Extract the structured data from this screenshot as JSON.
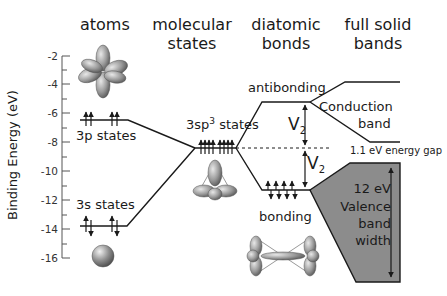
{
  "columns": {
    "atoms": "atoms",
    "molecular_line1": "molecular",
    "molecular_line2": "states",
    "diatomic_line1": "diatomic",
    "diatomic_line2": "bonds",
    "solid_line1": "full solid",
    "solid_line2": "bands"
  },
  "axis": {
    "label": "Binding Energy (eV)",
    "ticks": [
      "-2",
      "-4",
      "-6",
      "-8",
      "-10",
      "-12",
      "-14",
      "-16"
    ],
    "range": [
      -16,
      -2
    ]
  },
  "levels": {
    "p_states": "3p states",
    "s_states": "3s states",
    "sp3_prefix": "3sp",
    "sp3_sup": "3",
    "sp3_suffix": " states",
    "antibonding": "antibonding",
    "bonding": "bonding",
    "conduction_line1": "Conduction",
    "conduction_line2": "band",
    "gap": "1.1 eV energy gap",
    "valence_line1": "12 eV",
    "valence_line2": "Valence",
    "valence_line3": "band",
    "valence_line4": "width",
    "v2_main": "V",
    "v2_sub": "2"
  },
  "energies_eV": {
    "3p": -6.5,
    "3s": -13.7,
    "sp3": -8.4,
    "antibonding": -5.3,
    "bonding": -11.4,
    "conduction_band_top": -3.9,
    "conduction_band_bottom": -8.0,
    "valence_band_top": -9.1,
    "valence_band_bottom": -17.3
  },
  "colors": {
    "line": "#1a1a1a",
    "valence_fill": "#8c8c8c",
    "orbital": "#9a9a9a"
  }
}
